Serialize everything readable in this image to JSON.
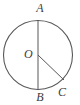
{
  "figure": {
    "kind": "geometry-diagram",
    "background_color": "#ffffff",
    "stroke_color": "#58585a",
    "label_color": "#3b3b3d",
    "canvas": {
      "width": 80,
      "height": 105
    },
    "circle": {
      "name": "circle-O",
      "center_x": 38,
      "center_y": 55,
      "radius": 35
    },
    "segments": [
      {
        "name": "diameter-AB",
        "from": "A",
        "to": "B",
        "x1": 38,
        "y1": 20,
        "x2": 38,
        "y2": 90
      },
      {
        "name": "radius-OC",
        "from": "O",
        "to": "C",
        "x1": 38,
        "y1": 55,
        "x2": 64,
        "y2": 80
      }
    ],
    "points": [
      {
        "id": "A",
        "label": "A",
        "x": 38,
        "y": 20,
        "position": "top"
      },
      {
        "id": "B",
        "label": "B",
        "x": 38,
        "y": 90,
        "position": "bottom"
      },
      {
        "id": "C",
        "label": "C",
        "x": 64,
        "y": 80,
        "position": "lower-right"
      },
      {
        "id": "O",
        "label": "O",
        "x": 38,
        "y": 55,
        "position": "center"
      }
    ]
  }
}
